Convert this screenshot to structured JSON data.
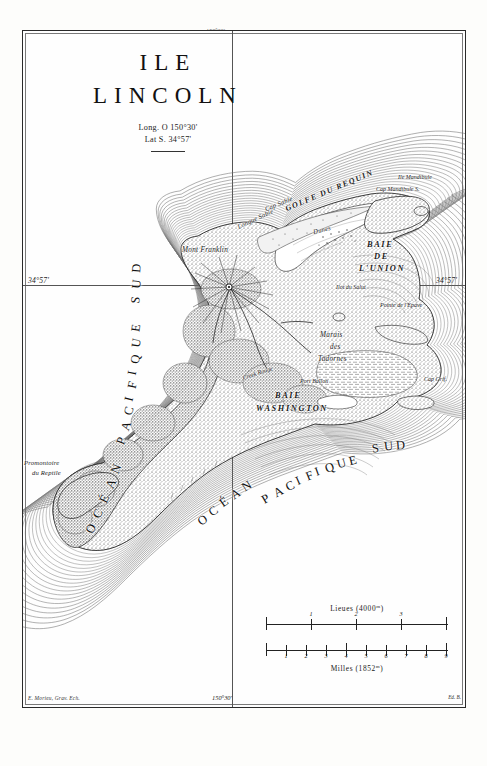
{
  "map": {
    "title_line1": "ILE",
    "title_line2": "LINCOLN",
    "coord_long": "Long. O 150°30'",
    "coord_lat": "Lat  S. 34°57'",
    "margin_lat_left": "34°57'",
    "margin_lat_right": "34°57'",
    "margin_long_bottom": "150°30'",
    "margin_long_top": "150°30'",
    "credit_engraver": "E. Morieu, Grav. Ech.",
    "credit_plate": "Ed. B."
  },
  "ocean_labels": [
    {
      "name": "ocean-pacifique-sud-west",
      "text": "OCÉAN   PACIFIQUE   SUD"
    },
    {
      "name": "ocean-pacifique-sud-south",
      "text": "OCÉAN   PACIFIQUE   SUD"
    }
  ],
  "ocean_west_letters": [
    "O",
    "C",
    "É",
    "A",
    "N",
    "",
    "P",
    "A",
    "C",
    "I",
    "F",
    "I",
    "Q",
    "U",
    "E",
    "",
    "S",
    "U",
    "D"
  ],
  "ocean_south_letters": [
    "O",
    "C",
    "É",
    "A",
    "N",
    "",
    "P",
    "A",
    "C",
    "I",
    "F",
    "I",
    "Q",
    "U",
    "E",
    "",
    "S",
    "U",
    "D"
  ],
  "features": {
    "golfe_requin": "GOLFE DU REQUIN",
    "baie_union_l1": "BAIE",
    "baie_union_l2": "DE",
    "baie_union_l3": "L'UNION",
    "baie_washington_l1": "BAIE",
    "baie_washington_l2": "WASHINGTON",
    "mont_franklin": "Mont Franklin",
    "cap_sable": "Cap Sable",
    "longue_sable": "Longue Sable",
    "dunes": "Dunes",
    "ile_mandibule": "Ile Mandibule",
    "cap_mandibule_s": "Cap Mandibule S.",
    "ilot_du_salut": "Ilot du Salut",
    "pointe_de_lepave": "Pointe de l'Épave",
    "marais_l1": "Marais",
    "marais_l2": "des",
    "marais_l3": "Tadornes",
    "cap_griffon": "Cap Griffon",
    "cap_grif": "Cap Grif.",
    "promontoire_l1": "Promontoire",
    "promontoire_l2": "du Reptile",
    "creek_rouge": "Creek Rouge",
    "port_ballon": "Port Ballon",
    "riviere_merci": "Rivière de la Merci"
  },
  "scales": [
    {
      "name": "lieues",
      "caption": "Lieues (4000",
      "caption_sup": "m",
      "caption_end": ")",
      "ticks": [
        "1",
        "2",
        "3",
        "4"
      ],
      "divisions": 4,
      "label_position": "above"
    },
    {
      "name": "milles",
      "caption": "Milles  (1852",
      "caption_sup": "m",
      "caption_end": ")",
      "ticks": [
        "1",
        "2",
        "3",
        "4",
        "5",
        "6",
        "7",
        "8",
        "9"
      ],
      "divisions": 9,
      "label_position": "below"
    }
  ],
  "colors": {
    "ink": "#1b1b1b",
    "paper": "#fdfdfb",
    "hachure": "#3a3a3a",
    "frame": "#2a2a2a"
  }
}
